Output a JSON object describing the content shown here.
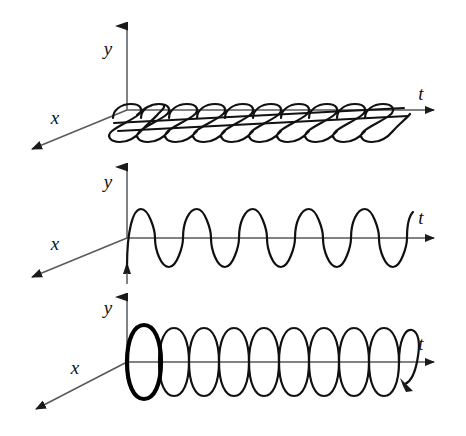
{
  "figure": {
    "title": "",
    "background_color": "#ffffff",
    "ink_color": "#111111",
    "axis_color": "#555a5c",
    "width": 466,
    "height": 436,
    "panel_count": 3
  },
  "panels": [
    {
      "id": "panel-top-view",
      "description": "helix seen nearly edge-on from above (looking down the y axis)",
      "origin": {
        "x": 127,
        "y": 110
      },
      "axes": [
        {
          "name": "y",
          "label": "y",
          "label_x": 108,
          "label_y": 55,
          "tip_x": 127,
          "tip_y": 14
        },
        {
          "name": "t",
          "label": "t",
          "label_x": 421,
          "label_y": 100,
          "tip_x": 444,
          "tip_y": 110
        },
        {
          "name": "x",
          "label": "x",
          "label_x": 55,
          "label_y": 122,
          "tip_x": 24,
          "tip_y": 153
        }
      ],
      "curve": {
        "type": "helix-projection",
        "loops": 10,
        "start_x": 127,
        "end_x": 405,
        "amplitude": 13,
        "skew": 20,
        "stroke_width": 2.2,
        "emphasis_loop": 0
      }
    },
    {
      "id": "panel-front-view",
      "description": "sine wave seen from the front (projection on the y-t plane)",
      "origin": {
        "x": 127,
        "y": 238
      },
      "axes": [
        {
          "name": "y",
          "label": "y",
          "label_x": 108,
          "label_y": 186,
          "tip_x": 127,
          "tip_y": 155
        },
        {
          "name": "t",
          "label": "t",
          "label_x": 421,
          "label_y": 222,
          "tip_x": 444,
          "tip_y": 238
        },
        {
          "name": "x",
          "label": "x",
          "label_x": 55,
          "label_y": 248,
          "tip_x": 24,
          "tip_y": 281
        }
      ],
      "curve": {
        "type": "sine",
        "cycles": 10,
        "start_x": 127,
        "end_x": 409,
        "amplitude": 29,
        "stroke_width": 2.2,
        "phase_deg": 0
      }
    },
    {
      "id": "panel-perspective-view",
      "description": "helix drawn in perspective with the first turn emphasised at the origin and a direction arrow on the last turn",
      "origin": {
        "x": 127,
        "y": 362
      },
      "axes": [
        {
          "name": "y",
          "label": "y",
          "label_x": 108,
          "label_y": 312,
          "tip_x": 127,
          "tip_y": 285
        },
        {
          "name": "t",
          "label": "t",
          "label_x": 421,
          "label_y": 348,
          "tip_x": 444,
          "tip_y": 362
        },
        {
          "name": "x",
          "label": "x",
          "label_x": 75,
          "label_y": 372,
          "tip_x": 28,
          "tip_y": 412
        }
      ],
      "curve": {
        "type": "helix",
        "loops": 10,
        "start_x": 127,
        "end_x": 410,
        "amplitude": 32,
        "ellipse_half_width": 16,
        "stroke_width": 2.2,
        "emphasis_loop": 1,
        "emphasis_stroke_width": 4.2,
        "direction_arrow": true
      }
    }
  ],
  "labels": {
    "y": "y",
    "t": "t",
    "x": "x"
  }
}
